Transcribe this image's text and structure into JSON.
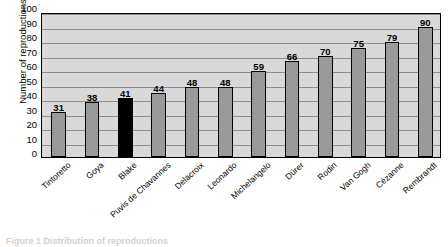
{
  "chart_data": {
    "type": "bar",
    "title": "",
    "subtitle": "",
    "xlabel": "",
    "ylabel": "Number of reproductions",
    "ylim": [
      0,
      100
    ],
    "ytick_step": 10,
    "yticks": [
      100,
      90,
      80,
      70,
      60,
      50,
      40,
      30,
      20,
      10,
      0
    ],
    "grid": true,
    "legend": "none",
    "categories": [
      "Tintoretto",
      "Goya",
      "Blake",
      "Puvis de Chavannes",
      "Delacroix",
      "Leonardo",
      "Michelangelo",
      "Dürer",
      "Rodin",
      "Van Gogh",
      "Cézanne",
      "Rembrandt"
    ],
    "values": [
      31,
      38,
      41,
      44,
      48,
      48,
      59,
      66,
      70,
      75,
      79,
      90
    ],
    "data_labels": [
      "31",
      "38",
      "41",
      "44",
      "48",
      "48",
      "59",
      "66",
      "70",
      "75",
      "79",
      "90"
    ],
    "highlight_index": 2,
    "colors": {
      "bar": "#9a9a9a",
      "bar_highlight": "#000000",
      "bar_border": "#000000",
      "plot_background": "#d9d9d9",
      "gridline": "#8c8c8c",
      "frame": "#000000",
      "text": "#000000"
    }
  },
  "caption": "Figure 1 Distribution of reproductions"
}
